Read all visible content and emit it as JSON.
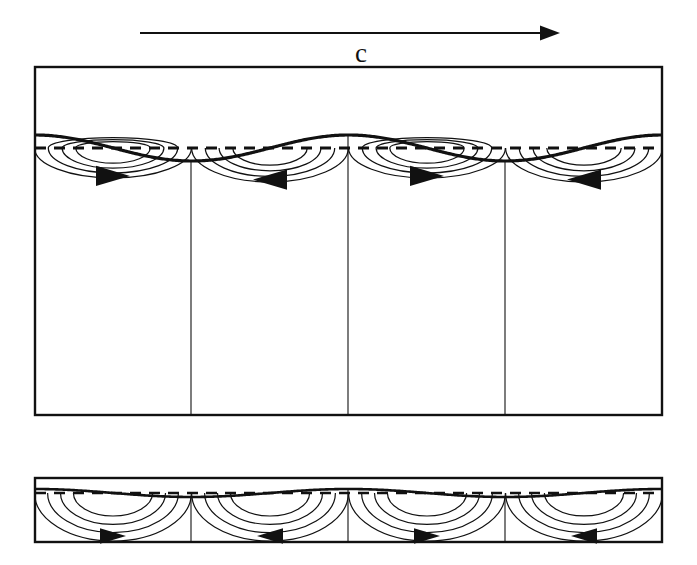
{
  "figure": {
    "background_color": "#ffffff",
    "line_color": "#111111",
    "width": 697,
    "height": 565
  },
  "celerity_arrow": {
    "label": "c",
    "meaning": "wave celerity direction",
    "direction": "right",
    "x_start": 140,
    "x_end": 560,
    "y": 33,
    "label_x": 355,
    "label_y": 40
  },
  "panels": [
    {
      "id": "deep-water",
      "name": "deep-water-panel",
      "box": {
        "x": 35,
        "y": 67,
        "width": 627,
        "height": 348
      },
      "still_water_level_y": 148,
      "wave": {
        "amplitude": 13,
        "wavelength": 313.5,
        "phase": "crest-first",
        "cells": 4
      },
      "orbit_style": "circular-decaying",
      "cells": [
        {
          "index": 0,
          "type": "crest",
          "arrow_direction": "right",
          "center_x": 113,
          "arcs": 4
        },
        {
          "index": 1,
          "type": "trough",
          "arrow_direction": "left",
          "center_x": 270,
          "arcs": 4
        },
        {
          "index": 2,
          "type": "crest",
          "arrow_direction": "right",
          "center_x": 427,
          "arcs": 4
        },
        {
          "index": 3,
          "type": "trough",
          "arrow_direction": "left",
          "center_x": 584,
          "arcs": 4
        }
      ],
      "dividers_x": [
        191,
        348,
        505
      ]
    },
    {
      "id": "shallow-water",
      "name": "shallow-water-panel",
      "box": {
        "x": 35,
        "y": 478,
        "width": 627,
        "height": 64
      },
      "still_water_level_y": 493,
      "wave": {
        "amplitude": 4,
        "wavelength": 313.5,
        "phase": "crest-first",
        "cells": 4
      },
      "orbit_style": "flattened-elliptical",
      "cells": [
        {
          "index": 0,
          "type": "crest",
          "arrow_direction": "right",
          "center_x": 113,
          "arcs": 4
        },
        {
          "index": 1,
          "type": "trough",
          "arrow_direction": "left",
          "center_x": 270,
          "arcs": 4
        },
        {
          "index": 2,
          "type": "crest",
          "arrow_direction": "right",
          "center_x": 427,
          "arcs": 4
        },
        {
          "index": 3,
          "type": "trough",
          "arrow_direction": "left",
          "center_x": 584,
          "arcs": 4
        }
      ],
      "dividers_x": [
        191,
        348,
        505
      ]
    }
  ],
  "still_water_line": {
    "style": "dashed",
    "dash_pattern": "11 8"
  }
}
